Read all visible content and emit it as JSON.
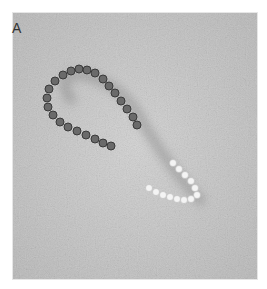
{
  "figure": {
    "panel_label": "A",
    "colors": {
      "background": "#c9c9c9",
      "dark_bead": "#5a5a5a",
      "light_bead": "#f2f2f2"
    }
  }
}
